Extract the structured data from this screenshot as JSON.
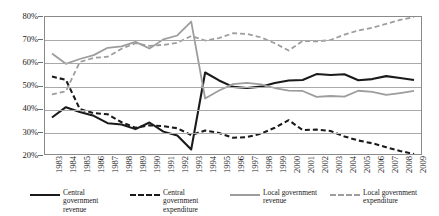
{
  "chart_data": {
    "type": "line",
    "title": "",
    "xlabel": "",
    "ylabel": "",
    "ylim": [
      20,
      80
    ],
    "ytick_labels": [
      "80%",
      "70%",
      "60%",
      "50%",
      "40%",
      "30%",
      "20%"
    ],
    "ytick_values": [
      80,
      70,
      60,
      50,
      40,
      30,
      20
    ],
    "grid": true,
    "legend_position": "bottom",
    "categories": [
      "1983",
      "1984",
      "1985",
      "1986",
      "1987",
      "1988",
      "1989",
      "1990",
      "1991",
      "1992",
      "1993",
      "1994",
      "1995",
      "1996",
      "1997",
      "1998",
      "1999",
      "2000",
      "2001",
      "2002",
      "2003",
      "2004",
      "2005",
      "2006",
      "2007",
      "2008",
      "2009"
    ],
    "series": [
      {
        "name": "Central government revenue",
        "style": "solid",
        "color": "#1a1a1a",
        "values": [
          36.0,
          40.5,
          38.4,
          36.7,
          33.5,
          32.9,
          30.9,
          33.8,
          29.8,
          28.1,
          22.0,
          55.7,
          52.2,
          49.4,
          48.9,
          49.5,
          51.1,
          52.2,
          52.4,
          55.0,
          54.6,
          54.9,
          52.3,
          52.8,
          54.1,
          53.3,
          52.4
        ]
      },
      {
        "name": "Central government expenditure",
        "style": "dashed",
        "color": "#1a1a1a",
        "values": [
          53.9,
          52.5,
          39.7,
          37.9,
          37.4,
          33.9,
          31.5,
          32.6,
          32.2,
          31.3,
          28.3,
          30.3,
          29.2,
          27.1,
          27.4,
          28.9,
          31.5,
          34.8,
          30.5,
          30.7,
          30.1,
          27.7,
          25.9,
          24.7,
          23.0,
          21.3,
          20.0
        ]
      },
      {
        "name": "Local government revenue",
        "style": "solid",
        "color": "#9d9d9d",
        "values": [
          64.0,
          59.5,
          61.6,
          63.3,
          66.5,
          67.1,
          69.1,
          66.2,
          70.2,
          71.9,
          78.0,
          44.3,
          47.8,
          50.6,
          51.1,
          50.5,
          48.9,
          47.8,
          47.6,
          45.0,
          45.4,
          45.1,
          47.7,
          47.2,
          45.9,
          46.7,
          47.6
        ]
      },
      {
        "name": "Local government expenditure",
        "style": "dashed",
        "color": "#9d9d9d",
        "values": [
          46.1,
          47.5,
          60.3,
          62.1,
          62.6,
          66.1,
          68.5,
          67.4,
          67.8,
          68.7,
          71.7,
          69.7,
          70.8,
          72.9,
          72.6,
          71.1,
          68.5,
          65.3,
          69.5,
          69.3,
          69.9,
          72.3,
          74.1,
          75.3,
          77.0,
          78.7,
          80.0
        ]
      }
    ]
  },
  "legend": {
    "items": [
      {
        "label": "Central government revenue",
        "swatch": "sw-solid-black"
      },
      {
        "label": "Central government expenditure",
        "swatch": "sw-dash-black"
      },
      {
        "label": "Local government revenue",
        "swatch": "sw-solid-gray"
      },
      {
        "label": "Local government expenditure",
        "swatch": "sw-dash-gray"
      }
    ]
  }
}
